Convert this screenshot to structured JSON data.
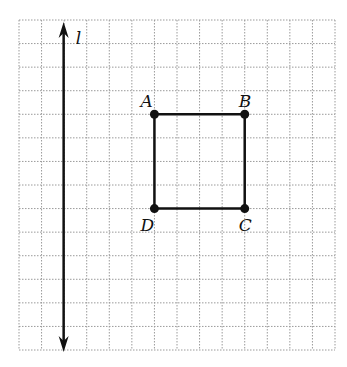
{
  "diagram": {
    "type": "grid-figure",
    "grid": {
      "cols": 14,
      "rows": 14,
      "x0": 19,
      "y0": 20,
      "x1": 335,
      "y1": 350
    },
    "line": {
      "label": "l",
      "orientation": "vertical",
      "arrows": "both"
    },
    "square": {
      "vertices": [
        {
          "label": "A",
          "col": 6,
          "row": 4
        },
        {
          "label": "B",
          "col": 10,
          "row": 4
        },
        {
          "label": "C",
          "col": 10,
          "row": 8
        },
        {
          "label": "D",
          "col": 6,
          "row": 8
        }
      ]
    }
  }
}
